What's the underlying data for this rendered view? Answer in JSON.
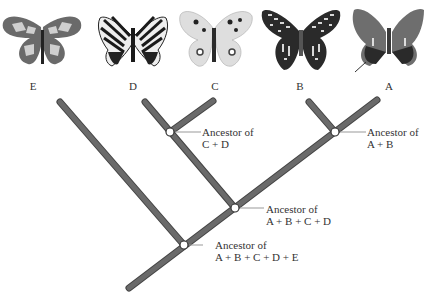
{
  "diagram": {
    "type": "phylogenetic-tree",
    "taxa": [
      {
        "id": "E",
        "label": "E",
        "x": 33
      },
      {
        "id": "D",
        "label": "D",
        "x": 133
      },
      {
        "id": "C",
        "label": "C",
        "x": 215
      },
      {
        "id": "B",
        "label": "B",
        "x": 300
      },
      {
        "id": "A",
        "label": "A",
        "x": 389
      }
    ],
    "nodes": [
      {
        "id": "cd",
        "line1": "Ancestor of",
        "line2": "C + D"
      },
      {
        "id": "ab",
        "line1": "Ancestor of",
        "line2": "A + B"
      },
      {
        "id": "abcd",
        "line1": "Ancestor of",
        "line2": "A + B + C + D"
      },
      {
        "id": "abcde",
        "line1": "Ancestor of",
        "line2": "A + B + C + D + E"
      }
    ],
    "colors": {
      "branch": "#666666",
      "branch_outline": "#444444",
      "node_fill": "#ffffff",
      "leader": "#999999"
    }
  }
}
